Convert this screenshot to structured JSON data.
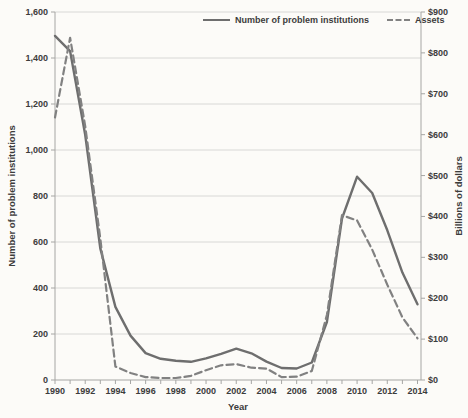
{
  "chart_data": {
    "type": "line",
    "title": "",
    "x": {
      "title": "Year",
      "min": 1990,
      "max": 2014,
      "label_step": 2,
      "tick_labels": [
        "1990",
        "1992",
        "1994",
        "1996",
        "1998",
        "2000",
        "2002",
        "2004",
        "2006",
        "2008",
        "2010",
        "2012",
        "2014"
      ]
    },
    "y_left": {
      "title": "Number of problem institutions",
      "max": 1600,
      "tick_step": 200,
      "tick_labels": [
        "0",
        "200",
        "400",
        "600",
        "800",
        "1,000",
        "1,200",
        "1,400",
        "1,600"
      ]
    },
    "y_right": {
      "title": "Billions of dollars",
      "max": 900,
      "tick_step": 100,
      "tick_labels": [
        "$0",
        "$100",
        "$200",
        "$300",
        "$400",
        "$500",
        "$600",
        "$700",
        "$800",
        "$900"
      ]
    },
    "years": [
      1990,
      1991,
      1992,
      1993,
      1994,
      1995,
      1996,
      1997,
      1998,
      1999,
      2000,
      2001,
      2002,
      2003,
      2004,
      2005,
      2006,
      2007,
      2008,
      2009,
      2010,
      2011,
      2012,
      2013,
      2014
    ],
    "series": [
      {
        "name": "Number of problem institutions",
        "axis": "left",
        "style": "solid",
        "values": [
          1496,
          1430,
          1066,
          572,
          318,
          193,
          117,
          92,
          84,
          79,
          94,
          114,
          136,
          116,
          80,
          52,
          50,
          76,
          252,
          702,
          884,
          813,
          651,
          467,
          329
        ]
      },
      {
        "name": "Assets",
        "axis": "right",
        "style": "dashed",
        "values": [
          642,
          837,
          621,
          346,
          33,
          17,
          7,
          5,
          5,
          10,
          24,
          36,
          39,
          30,
          28,
          7,
          8,
          22,
          159,
          403,
          390,
          319,
          233,
          153,
          102
        ]
      }
    ],
    "legend": {
      "position": "top",
      "items": [
        "Number of problem institutions",
        "Assets"
      ]
    },
    "colors": {
      "background": "#fcfbf8",
      "grid": "#d8d8d6",
      "axis": "#a6a6a4",
      "line_solid": "#6e6e6e",
      "line_dashed": "#818181",
      "text": "#3c3c3c"
    }
  }
}
